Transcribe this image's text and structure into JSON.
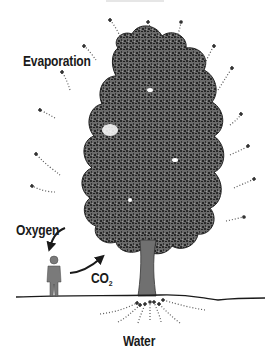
{
  "diagram": {
    "title": "",
    "labels": {
      "evaporation": "Evaporation",
      "oxygen": "Oxygen",
      "co2_main": "CO",
      "co2_sub": "2",
      "water": "Water"
    },
    "elements": {
      "tree": "deciduous-tree",
      "person": "standing-person-silhouette",
      "ground": "ground-line"
    },
    "arrows": [
      {
        "name": "evaporation-arrows",
        "direction": "outward-from-canopy",
        "style": "dotted"
      },
      {
        "name": "oxygen-arrow",
        "from": "tree",
        "to": "person",
        "style": "solid"
      },
      {
        "name": "co2-arrow",
        "from": "person",
        "to": "tree",
        "style": "solid"
      },
      {
        "name": "water-arrows",
        "direction": "inward-to-roots",
        "style": "dotted"
      }
    ],
    "colors": {
      "canopy_dark": "#2b2b2b",
      "canopy_mid": "#6e6e6e",
      "trunk": "#707070",
      "person": "#7a7a7a",
      "text": "#1a1a1a",
      "dots": "#555555"
    }
  }
}
